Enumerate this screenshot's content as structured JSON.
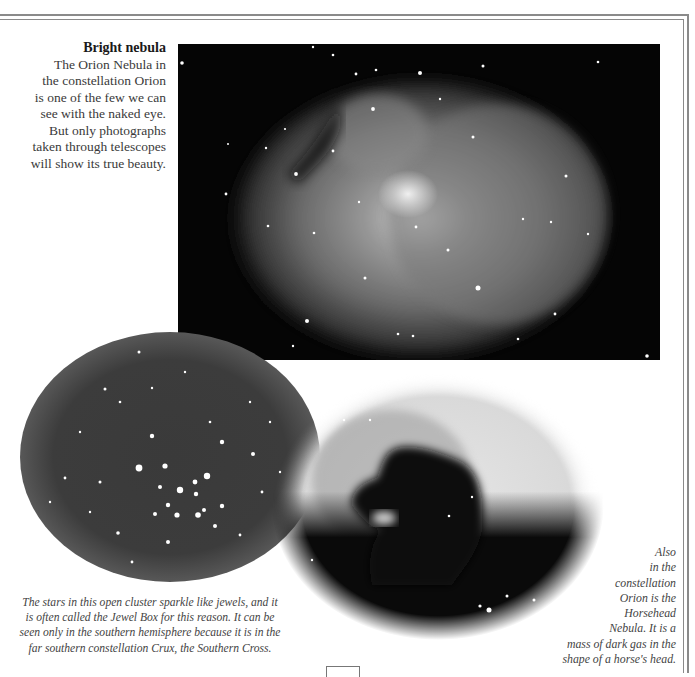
{
  "page": {
    "border_color": "#8a8a8a",
    "background": "#ffffff"
  },
  "caption_top": {
    "title": "Bright nebula",
    "lines": [
      "The Orion Nebula in",
      "the constellation Orion",
      "is one of the few we can",
      "see with the naked eye.",
      "But only photographs",
      "taken through telescopes",
      "will show its true beauty."
    ]
  },
  "images": {
    "orion": {
      "label": "Orion Nebula photograph"
    },
    "jewel_box": {
      "label": "Jewel Box open star cluster photograph"
    },
    "horsehead": {
      "label": "Horsehead Nebula photograph"
    }
  },
  "caption_jewel": {
    "lines": [
      "The stars in this open cluster sparkle like jewels, and it",
      "is often called the Jewel Box for this reason. It can be",
      "seen only in the southern hemisphere because it is in the",
      "far southern constellation Crux, the Southern Cross."
    ]
  },
  "caption_horse": {
    "lines": [
      "Also",
      "in the",
      "constellation",
      "Orion is the",
      "Horsehead",
      "Nebula. It is a",
      "mass of dark gas in the",
      "shape of a horse's head."
    ]
  },
  "page_number": ""
}
